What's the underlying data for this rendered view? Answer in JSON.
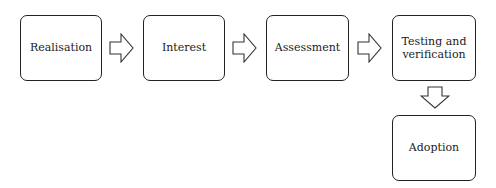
{
  "diagram": {
    "type": "flowchart",
    "steps": [
      {
        "label": "Realisation"
      },
      {
        "label": "Interest"
      },
      {
        "label": "Assessment"
      },
      {
        "label": "Testing and\nverification"
      },
      {
        "label": "Adoption"
      }
    ],
    "connections": [
      {
        "from": 0,
        "to": 1,
        "direction": "right"
      },
      {
        "from": 1,
        "to": 2,
        "direction": "right"
      },
      {
        "from": 2,
        "to": 3,
        "direction": "right"
      },
      {
        "from": 3,
        "to": 4,
        "direction": "down"
      }
    ]
  }
}
